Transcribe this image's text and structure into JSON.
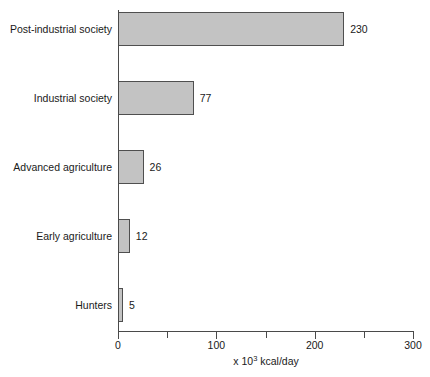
{
  "chart_data": {
    "type": "bar",
    "orientation": "horizontal",
    "title": "",
    "xlabel": "x 10³ kcal/day",
    "xlabel_prefix": "x 10",
    "xlabel_exponent": "3",
    "xlabel_suffix": " kcal/day",
    "ylabel": "",
    "categories": [
      "Post-industrial society",
      "Industrial society",
      "Advanced agriculture",
      "Early agriculture",
      "Hunters"
    ],
    "values": [
      230,
      77,
      26,
      12,
      5
    ],
    "value_labels": [
      "230",
      "77",
      "26",
      "12",
      "5"
    ],
    "xlim": [
      0,
      300
    ],
    "xticks": [
      0,
      50,
      100,
      150,
      200,
      250,
      300
    ],
    "xtick_labels": [
      "0",
      "",
      "100",
      "",
      "200",
      "",
      "300"
    ],
    "grid": false,
    "legend": null,
    "colors": {
      "bar_fill": "#c3c3c3",
      "bar_border": "#4f4f4f",
      "axis": "#4a4a4a",
      "text": "#1a1a1a",
      "background": "#ffffff"
    }
  }
}
